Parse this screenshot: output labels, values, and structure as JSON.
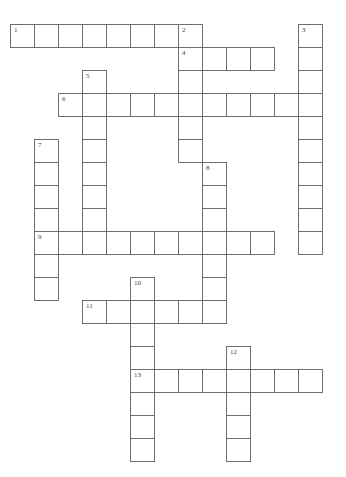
{
  "puzzle": {
    "type": "crossword",
    "grid": {
      "origin_x": 10,
      "origin_y": 24,
      "cell_w": 24,
      "cell_h": 23,
      "cols": 13,
      "rows": 19
    },
    "colors": {
      "cell_border": "#6e6e6e",
      "cell_fill": "#ffffff",
      "number_text": "#444444",
      "background": "#ffffff"
    },
    "words": [
      {
        "number": "1",
        "direction": "across",
        "row": 0,
        "col": 0,
        "length": 8
      },
      {
        "number": "2",
        "direction": "down",
        "row": 0,
        "col": 7,
        "length": 6
      },
      {
        "number": "3",
        "direction": "down",
        "row": 0,
        "col": 12,
        "length": 10
      },
      {
        "number": "4",
        "direction": "across",
        "row": 1,
        "col": 7,
        "length": 4
      },
      {
        "number": "5",
        "direction": "down",
        "row": 2,
        "col": 3,
        "length": 8
      },
      {
        "number": "6",
        "direction": "across",
        "row": 3,
        "col": 2,
        "length": 11
      },
      {
        "number": "7",
        "direction": "down",
        "row": 5,
        "col": 1,
        "length": 7
      },
      {
        "number": "8",
        "direction": "down",
        "row": 6,
        "col": 8,
        "length": 7
      },
      {
        "number": "9",
        "direction": "across",
        "row": 9,
        "col": 1,
        "length": 10
      },
      {
        "number": "10",
        "direction": "down",
        "row": 11,
        "col": 5,
        "length": 8
      },
      {
        "number": "11",
        "direction": "across",
        "row": 12,
        "col": 3,
        "length": 6
      },
      {
        "number": "12",
        "direction": "down",
        "row": 14,
        "col": 9,
        "length": 5
      },
      {
        "number": "13",
        "direction": "across",
        "row": 15,
        "col": 5,
        "length": 8
      }
    ]
  }
}
